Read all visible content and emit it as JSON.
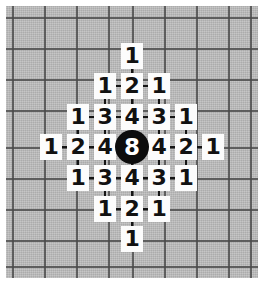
{
  "figure": {
    "name": "distance-grid-diagram",
    "background_color": "#ffffff",
    "paper_color": "#b8b8b8",
    "gridline_color": "#4a4a4a",
    "cell_background": "#fcfcfc",
    "cell_text_color": "#111111",
    "center_fill": "#0d0d0d",
    "center_text_color": "#ffffff"
  },
  "grid": {
    "columns_x": [
      12,
      44,
      76,
      108,
      132,
      164,
      196,
      228,
      250
    ],
    "rows_y": [
      17,
      48,
      79,
      110,
      147,
      178,
      209,
      240,
      266
    ],
    "cell_spacing_x": 32,
    "cell_spacing_y": 31
  },
  "center_node": {
    "label": "8",
    "x": 132,
    "y": 147,
    "radius": 17
  },
  "chart_data": {
    "type": "heatmap",
    "title": "",
    "xlabel": "",
    "ylabel": "",
    "center_value": 8,
    "grid_rows": [
      [
        null,
        null,
        null,
        null,
        "1",
        null,
        null,
        null,
        null
      ],
      [
        null,
        null,
        null,
        "1",
        "2",
        "1",
        null,
        null,
        null
      ],
      [
        null,
        null,
        "1",
        "3",
        "4",
        "3",
        "1",
        null,
        null
      ],
      [
        null,
        "1",
        "2",
        "4",
        "8",
        "4",
        "2",
        "1",
        null
      ],
      [
        null,
        null,
        "1",
        "3",
        "4",
        "3",
        "1",
        null,
        null
      ],
      [
        null,
        null,
        null,
        "1",
        "2",
        "1",
        null,
        null,
        null
      ],
      [
        null,
        null,
        null,
        null,
        "1",
        null,
        null,
        null,
        null
      ]
    ]
  },
  "cells": [
    {
      "label": "1",
      "x": 132,
      "y": 56,
      "name": "cell-r0-c4"
    },
    {
      "label": "1",
      "x": 105,
      "y": 86,
      "name": "cell-r1-c3"
    },
    {
      "label": "2",
      "x": 132,
      "y": 86,
      "name": "cell-r1-c4"
    },
    {
      "label": "1",
      "x": 159,
      "y": 86,
      "name": "cell-r1-c5"
    },
    {
      "label": "1",
      "x": 78,
      "y": 117,
      "name": "cell-r2-c2"
    },
    {
      "label": "3",
      "x": 105,
      "y": 117,
      "name": "cell-r2-c3"
    },
    {
      "label": "4",
      "x": 132,
      "y": 117,
      "name": "cell-r2-c4"
    },
    {
      "label": "3",
      "x": 159,
      "y": 117,
      "name": "cell-r2-c5"
    },
    {
      "label": "1",
      "x": 186,
      "y": 117,
      "name": "cell-r2-c6"
    },
    {
      "label": "1",
      "x": 51,
      "y": 147,
      "name": "cell-r3-c1"
    },
    {
      "label": "2",
      "x": 78,
      "y": 147,
      "name": "cell-r3-c2"
    },
    {
      "label": "4",
      "x": 105,
      "y": 147,
      "name": "cell-r3-c3"
    },
    {
      "label": "4",
      "x": 159,
      "y": 147,
      "name": "cell-r3-c5"
    },
    {
      "label": "2",
      "x": 186,
      "y": 147,
      "name": "cell-r3-c6"
    },
    {
      "label": "1",
      "x": 213,
      "y": 147,
      "name": "cell-r3-c7"
    },
    {
      "label": "1",
      "x": 78,
      "y": 178,
      "name": "cell-r4-c2"
    },
    {
      "label": "3",
      "x": 105,
      "y": 178,
      "name": "cell-r4-c3"
    },
    {
      "label": "4",
      "x": 132,
      "y": 178,
      "name": "cell-r4-c4"
    },
    {
      "label": "3",
      "x": 159,
      "y": 178,
      "name": "cell-r4-c5"
    },
    {
      "label": "1",
      "x": 186,
      "y": 178,
      "name": "cell-r4-c6"
    },
    {
      "label": "1",
      "x": 105,
      "y": 209,
      "name": "cell-r5-c3"
    },
    {
      "label": "2",
      "x": 132,
      "y": 209,
      "name": "cell-r5-c4"
    },
    {
      "label": "1",
      "x": 159,
      "y": 209,
      "name": "cell-r5-c5"
    },
    {
      "label": "1",
      "x": 132,
      "y": 239,
      "name": "cell-r6-c4"
    }
  ],
  "connectors": {
    "horizontal_runs": [
      {
        "y": 86,
        "x1": 105,
        "x2": 159
      },
      {
        "y": 117,
        "x1": 78,
        "x2": 186
      },
      {
        "y": 147,
        "x1": 51,
        "x2": 213
      },
      {
        "y": 178,
        "x1": 78,
        "x2": 186
      },
      {
        "y": 209,
        "x1": 105,
        "x2": 159
      }
    ],
    "vertical_runs": [
      {
        "x": 105,
        "y1": 86,
        "y2": 209
      },
      {
        "x": 132,
        "y1": 56,
        "y2": 239
      },
      {
        "x": 159,
        "y1": 86,
        "y2": 209
      },
      {
        "x": 78,
        "y1": 117,
        "y2": 178
      },
      {
        "x": 186,
        "y1": 117,
        "y2": 178
      }
    ]
  }
}
